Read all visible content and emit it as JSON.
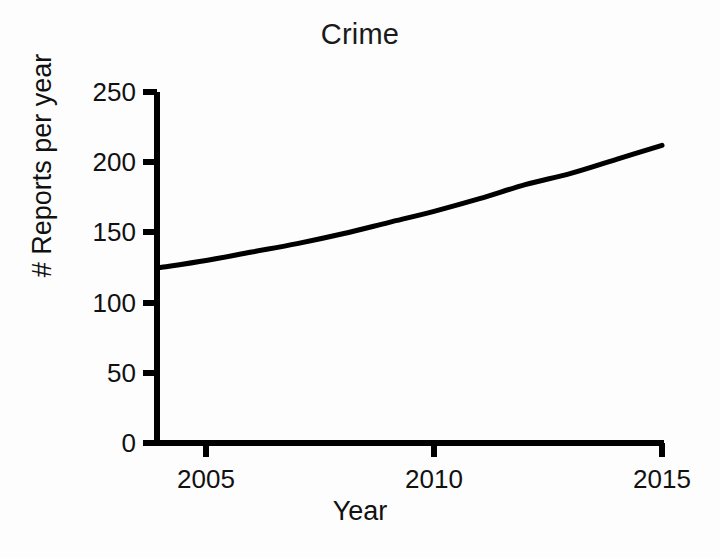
{
  "chart_data": {
    "type": "line",
    "title": "Crime",
    "xlabel": "Year",
    "ylabel": "# Reports per year",
    "xlim": [
      2003.9,
      2015
    ],
    "ylim": [
      0,
      250
    ],
    "xticks": [
      2005,
      2010,
      2015
    ],
    "xtick_labels": [
      "2005",
      "2010",
      "2015"
    ],
    "yticks": [
      0,
      50,
      100,
      150,
      200,
      250
    ],
    "ytick_labels": [
      "0",
      "50",
      "100",
      "150",
      "200",
      "250"
    ],
    "grid": false,
    "legend": false,
    "legend_position": "none",
    "series": [
      {
        "name": "Reports per year",
        "color": "#000000",
        "line_width": 5,
        "markers": false,
        "x": [
          2004,
          2005,
          2006,
          2007,
          2008,
          2009,
          2010,
          2011,
          2012,
          2013,
          2014,
          2015
        ],
        "values": [
          125,
          130,
          136,
          142,
          149,
          157,
          165,
          174,
          184,
          192,
          202,
          212
        ]
      }
    ],
    "annotations": [],
    "axis_style": "open-left-bottom"
  },
  "figure": {
    "background_color": "#fdfdfd",
    "axis_color": "#000000",
    "text_color": "#111111"
  }
}
